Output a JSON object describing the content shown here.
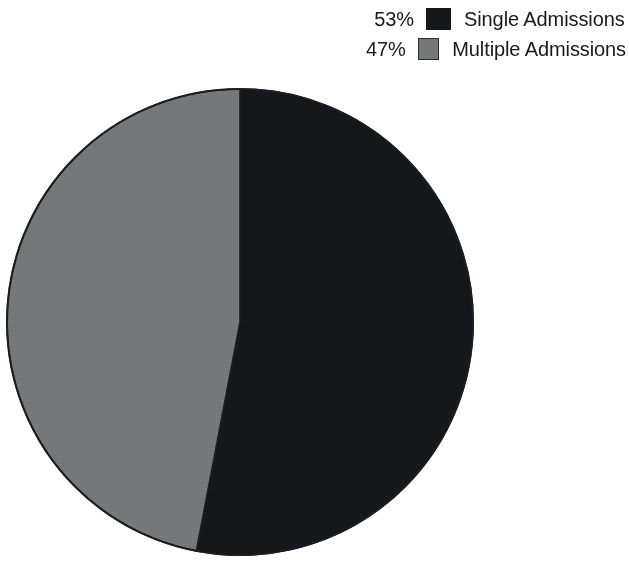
{
  "chart_data": {
    "type": "pie",
    "title": "",
    "subtitle": "",
    "xlabel": "",
    "ylabel": "",
    "categories": [
      "Single Admissions",
      "Multiple Admissions"
    ],
    "values": [
      53,
      47
    ],
    "value_unit": "%",
    "slices": [
      {
        "label": "Single Admissions",
        "value": 53,
        "display_value": "53%",
        "color": "#15171a",
        "start_angle_deg": 0,
        "end_angle_deg": 190.8
      },
      {
        "label": "Multiple Admissions",
        "value": 47,
        "display_value": "47%",
        "color": "#757779",
        "start_angle_deg": 190.8,
        "end_angle_deg": 360
      }
    ],
    "start_angle_deg": 0,
    "direction": "clockwise",
    "grid": false,
    "legend_position": "top-right",
    "legend": [
      {
        "percent": "53%",
        "label": "Single Admissions",
        "swatch": "#15171a"
      },
      {
        "percent": "47%",
        "label": "Multiple Admissions",
        "swatch": "#757779"
      }
    ],
    "geometry": {
      "center_x": 240,
      "center_y": 322,
      "radius": 233,
      "outline_color": "#1b1d1f"
    }
  },
  "legend": {
    "rows": [
      {
        "percent": "53%",
        "label": "Single Admissions",
        "swatch_name": "legend-swatch-black"
      },
      {
        "percent": "47%",
        "label": "Multiple Admissions",
        "swatch_name": "legend-swatch-grey"
      }
    ]
  },
  "colors": {
    "background": "#ffffff",
    "text": "#17191a",
    "slice_dark": "#15171a",
    "slice_grey": "#757779",
    "outline": "#1b1d1f"
  }
}
